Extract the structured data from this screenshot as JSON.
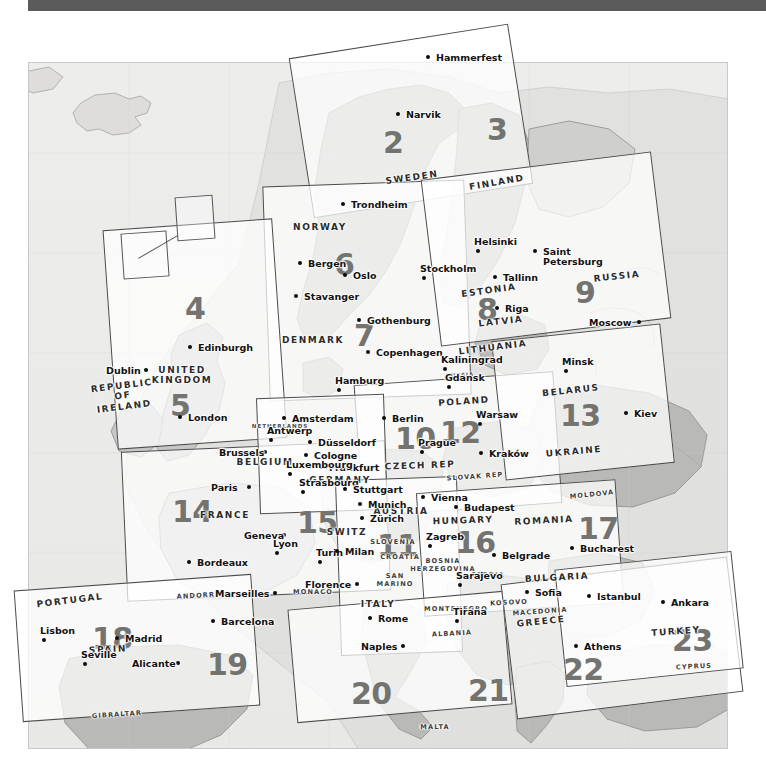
{
  "page": {
    "topbar_color": "#5a5a5a",
    "sheet_bg": "#ececeb",
    "land_fill": "#b9b9b7",
    "land_fill_light": "#d8d8d6",
    "tile_border": "#4b4b4b",
    "tile_number_color": "#73736f",
    "city_dot_color": "#0c0c0c"
  },
  "tiles": [
    {
      "id": "2",
      "label": "2"
    },
    {
      "id": "3",
      "label": "3"
    },
    {
      "id": "4",
      "label": "4"
    },
    {
      "id": "5",
      "label": "5"
    },
    {
      "id": "6",
      "label": "6"
    },
    {
      "id": "7",
      "label": "7"
    },
    {
      "id": "8",
      "label": "8"
    },
    {
      "id": "9",
      "label": "9"
    },
    {
      "id": "10",
      "label": "10"
    },
    {
      "id": "11",
      "label": "11"
    },
    {
      "id": "12",
      "label": "12"
    },
    {
      "id": "13",
      "label": "13"
    },
    {
      "id": "14",
      "label": "14"
    },
    {
      "id": "15",
      "label": "15"
    },
    {
      "id": "16",
      "label": "16"
    },
    {
      "id": "17",
      "label": "17"
    },
    {
      "id": "18",
      "label": "18"
    },
    {
      "id": "19",
      "label": "19"
    },
    {
      "id": "20",
      "label": "20"
    },
    {
      "id": "21",
      "label": "21"
    },
    {
      "id": "22",
      "label": "22"
    },
    {
      "id": "23",
      "label": "23"
    }
  ],
  "cities": [
    {
      "name": "Hammerfest",
      "x": 428,
      "y": 57,
      "dx": 8,
      "dy": -4
    },
    {
      "name": "Narvik",
      "x": 398,
      "y": 114,
      "dx": 8,
      "dy": -4
    },
    {
      "name": "Trondheim",
      "x": 343,
      "y": 204,
      "dx": 8,
      "dy": -4
    },
    {
      "name": "Bergen",
      "x": 300,
      "y": 263,
      "dx": 8,
      "dy": -4
    },
    {
      "name": "Oslo",
      "x": 345,
      "y": 275,
      "dx": 8,
      "dy": -4
    },
    {
      "name": "Stavanger",
      "x": 296,
      "y": 296,
      "dx": 8,
      "dy": -4
    },
    {
      "name": "Gothenburg",
      "x": 359,
      "y": 320,
      "dx": 8,
      "dy": -4
    },
    {
      "name": "Copenhagen",
      "x": 368,
      "y": 352,
      "dx": 8,
      "dy": -4
    },
    {
      "name": "Stockholm",
      "x": 424,
      "y": 278,
      "dx": -4,
      "dy": -14
    },
    {
      "name": "Helsinki",
      "x": 478,
      "y": 251,
      "dx": -4,
      "dy": -14
    },
    {
      "name": "Tallinn",
      "x": 495,
      "y": 277,
      "dx": 8,
      "dy": -4
    },
    {
      "name": "Riga",
      "x": 497,
      "y": 308,
      "dx": 8,
      "dy": -4
    },
    {
      "name": "Saint\nPetersburg",
      "x": 535,
      "y": 251,
      "dx": 8,
      "dy": -4
    },
    {
      "name": "Moscow",
      "x": 639,
      "y": 322,
      "dx": -50,
      "dy": -4
    },
    {
      "name": "Minsk",
      "x": 566,
      "y": 371,
      "dx": -4,
      "dy": -14
    },
    {
      "name": "Kiev",
      "x": 626,
      "y": 413,
      "dx": 8,
      "dy": -4
    },
    {
      "name": "Kaliningrad",
      "x": 445,
      "y": 369,
      "dx": -4,
      "dy": -14
    },
    {
      "name": "Gdansk",
      "x": 449,
      "y": 387,
      "dx": -4,
      "dy": -14
    },
    {
      "name": "Hamburg",
      "x": 339,
      "y": 390,
      "dx": -4,
      "dy": -14
    },
    {
      "name": "Warsaw",
      "x": 480,
      "y": 424,
      "dx": -4,
      "dy": -14
    },
    {
      "name": "Berlin",
      "x": 384,
      "y": 418,
      "dx": 8,
      "dy": -4
    },
    {
      "name": "Kraków",
      "x": 481,
      "y": 453,
      "dx": 8,
      "dy": -4
    },
    {
      "name": "Prague",
      "x": 422,
      "y": 452,
      "dx": -4,
      "dy": -14
    },
    {
      "name": "Amsterdam",
      "x": 284,
      "y": 418,
      "dx": 8,
      "dy": -4
    },
    {
      "name": "Antwerp",
      "x": 271,
      "y": 440,
      "dx": -4,
      "dy": -14
    },
    {
      "name": "Brussels",
      "x": 265,
      "y": 452,
      "dx": -46,
      "dy": -4
    },
    {
      "name": "Düsseldorf",
      "x": 310,
      "y": 442,
      "dx": 8,
      "dy": -4
    },
    {
      "name": "Cologne",
      "x": 306,
      "y": 455,
      "dx": 8,
      "dy": -4
    },
    {
      "name": "Frankfurt",
      "x": 321,
      "y": 467,
      "dx": 8,
      "dy": -4
    },
    {
      "name": "Luxembourg",
      "x": 290,
      "y": 474,
      "dx": -4,
      "dy": -14
    },
    {
      "name": "Strasbourg",
      "x": 303,
      "y": 492,
      "dx": -4,
      "dy": -14
    },
    {
      "name": "Stuttgart",
      "x": 345,
      "y": 489,
      "dx": 8,
      "dy": -4
    },
    {
      "name": "Munich",
      "x": 360,
      "y": 504,
      "dx": 8,
      "dy": -4
    },
    {
      "name": "Zürich",
      "x": 362,
      "y": 518,
      "dx": 8,
      "dy": -4
    },
    {
      "name": "Vienna",
      "x": 423,
      "y": 497,
      "dx": 8,
      "dy": -4
    },
    {
      "name": "Budapest",
      "x": 456,
      "y": 507,
      "dx": 8,
      "dy": -4
    },
    {
      "name": "Paris",
      "x": 249,
      "y": 487,
      "dx": -38,
      "dy": -4
    },
    {
      "name": "Geneva",
      "x": 284,
      "y": 535,
      "dx": -40,
      "dy": -4
    },
    {
      "name": "Lyon",
      "x": 277,
      "y": 553,
      "dx": -4,
      "dy": -14
    },
    {
      "name": "Bordeaux",
      "x": 189,
      "y": 562,
      "dx": 8,
      "dy": -4
    },
    {
      "name": "Marseilles",
      "x": 275,
      "y": 593,
      "dx": -60,
      "dy": -4
    },
    {
      "name": "Turin",
      "x": 320,
      "y": 562,
      "dx": -4,
      "dy": -14
    },
    {
      "name": "Milan",
      "x": 337,
      "y": 551,
      "dx": 8,
      "dy": -4
    },
    {
      "name": "Florence",
      "x": 357,
      "y": 584,
      "dx": -52,
      "dy": -4
    },
    {
      "name": "Rome",
      "x": 370,
      "y": 618,
      "dx": 8,
      "dy": -4
    },
    {
      "name": "Naples",
      "x": 403,
      "y": 646,
      "dx": -42,
      "dy": -4
    },
    {
      "name": "Zagreb",
      "x": 430,
      "y": 546,
      "dx": -4,
      "dy": -14
    },
    {
      "name": "Sarajevo",
      "x": 460,
      "y": 585,
      "dx": -4,
      "dy": -14
    },
    {
      "name": "Belgrade",
      "x": 494,
      "y": 555,
      "dx": 8,
      "dy": -4
    },
    {
      "name": "Bucharest",
      "x": 572,
      "y": 548,
      "dx": 8,
      "dy": -4
    },
    {
      "name": "Sofia",
      "x": 527,
      "y": 592,
      "dx": 8,
      "dy": -4
    },
    {
      "name": "Tirana",
      "x": 457,
      "y": 621,
      "dx": -4,
      "dy": -14
    },
    {
      "name": "Athens",
      "x": 576,
      "y": 646,
      "dx": 8,
      "dy": -4
    },
    {
      "name": "Istanbul",
      "x": 589,
      "y": 596,
      "dx": 8,
      "dy": -4
    },
    {
      "name": "Ankara",
      "x": 663,
      "y": 602,
      "dx": 8,
      "dy": -4
    },
    {
      "name": "Dublin",
      "x": 146,
      "y": 370,
      "dx": -40,
      "dy": -4
    },
    {
      "name": "Edinburgh",
      "x": 190,
      "y": 347,
      "dx": 8,
      "dy": -4
    },
    {
      "name": "London",
      "x": 180,
      "y": 417,
      "dx": 8,
      "dy": -4
    },
    {
      "name": "Lisbon",
      "x": 44,
      "y": 640,
      "dx": -4,
      "dy": -14
    },
    {
      "name": "Madrid",
      "x": 117,
      "y": 638,
      "dx": 8,
      "dy": -4
    },
    {
      "name": "Seville",
      "x": 85,
      "y": 664,
      "dx": -4,
      "dy": -14
    },
    {
      "name": "Alicante",
      "x": 178,
      "y": 663,
      "dx": -46,
      "dy": -4
    },
    {
      "name": "Barcelona",
      "x": 213,
      "y": 621,
      "dx": 8,
      "dy": -4
    }
  ],
  "countries": [
    {
      "name": "SWEDEN",
      "x": 412,
      "y": 178,
      "size": "md",
      "rot": -8
    },
    {
      "name": "FINLAND",
      "x": 497,
      "y": 183,
      "size": "md",
      "rot": -10
    },
    {
      "name": "NORWAY",
      "x": 320,
      "y": 228,
      "size": "md",
      "rot": 0
    },
    {
      "name": "DENMARK",
      "x": 313,
      "y": 341,
      "size": "md",
      "rot": 0
    },
    {
      "name": "ESTONIA",
      "x": 489,
      "y": 291,
      "size": "md",
      "rot": -8
    },
    {
      "name": "LATVIA",
      "x": 501,
      "y": 322,
      "size": "md",
      "rot": -6
    },
    {
      "name": "LITHUANIA",
      "x": 493,
      "y": 348,
      "size": "md",
      "rot": -7
    },
    {
      "name": "RUSSIA",
      "x": 617,
      "y": 277,
      "size": "md",
      "rot": -6
    },
    {
      "name": "RUSSIA",
      "x": 460,
      "y": 376,
      "size": "xs",
      "rot": -3
    },
    {
      "name": "BELARUS",
      "x": 571,
      "y": 391,
      "size": "md",
      "rot": -6
    },
    {
      "name": "UKRAINE",
      "x": 574,
      "y": 452,
      "size": "md",
      "rot": -5
    },
    {
      "name": "POLAND",
      "x": 464,
      "y": 402,
      "size": "md",
      "rot": -4
    },
    {
      "name": "NETHERLANDS",
      "x": 280,
      "y": 427,
      "size": "xs",
      "rot": 0
    },
    {
      "name": "BELGIUM",
      "x": 265,
      "y": 463,
      "size": "md",
      "rot": 0
    },
    {
      "name": "GERMANY",
      "x": 340,
      "y": 481,
      "size": "md",
      "rot": 0
    },
    {
      "name": "CZECH REP",
      "x": 420,
      "y": 466,
      "size": "md",
      "rot": -2
    },
    {
      "name": "SLOVAK REP",
      "x": 475,
      "y": 477,
      "size": "sm",
      "rot": -4
    },
    {
      "name": "AUSTRIA",
      "x": 401,
      "y": 512,
      "size": "md",
      "rot": 0
    },
    {
      "name": "HUNGARY",
      "x": 463,
      "y": 521,
      "size": "md",
      "rot": -2
    },
    {
      "name": "ROMANIA",
      "x": 544,
      "y": 521,
      "size": "md",
      "rot": -3
    },
    {
      "name": "MOLDOVA",
      "x": 592,
      "y": 495,
      "size": "sm",
      "rot": -6
    },
    {
      "name": "SWITZ",
      "x": 347,
      "y": 533,
      "size": "md",
      "rot": 0
    },
    {
      "name": "FRANCE",
      "x": 225,
      "y": 516,
      "size": "md",
      "rot": 0
    },
    {
      "name": "SLOVENIA",
      "x": 393,
      "y": 542,
      "size": "sm",
      "rot": 0
    },
    {
      "name": "CROATIA",
      "x": 400,
      "y": 557,
      "size": "sm",
      "rot": 0
    },
    {
      "name": "BOSNIA\nHERZEGOVINA",
      "x": 443,
      "y": 566,
      "size": "sm",
      "rot": 0
    },
    {
      "name": "SERBIA",
      "x": 488,
      "y": 575,
      "size": "sm",
      "rot": 0
    },
    {
      "name": "MONTENEGRO",
      "x": 456,
      "y": 609,
      "size": "sm",
      "rot": 0
    },
    {
      "name": "KOSOVO",
      "x": 509,
      "y": 603,
      "size": "sm",
      "rot": -3
    },
    {
      "name": "MACEDONIA",
      "x": 540,
      "y": 612,
      "size": "sm",
      "rot": -4
    },
    {
      "name": "ALBANIA",
      "x": 452,
      "y": 634,
      "size": "sm",
      "rot": -3
    },
    {
      "name": "BULGARIA",
      "x": 557,
      "y": 578,
      "size": "md",
      "rot": -3
    },
    {
      "name": "GREECE",
      "x": 541,
      "y": 622,
      "size": "md",
      "rot": -6
    },
    {
      "name": "TURKEY",
      "x": 676,
      "y": 632,
      "size": "md",
      "rot": -4
    },
    {
      "name": "CYPRUS",
      "x": 694,
      "y": 667,
      "size": "sm",
      "rot": -3
    },
    {
      "name": "ITALY",
      "x": 378,
      "y": 605,
      "size": "md",
      "rot": 0
    },
    {
      "name": "SAN\nMARINO",
      "x": 395,
      "y": 581,
      "size": "sm",
      "rot": 0
    },
    {
      "name": "MONACO",
      "x": 313,
      "y": 592,
      "size": "sm",
      "rot": 0
    },
    {
      "name": "ANDORRA",
      "x": 199,
      "y": 596,
      "size": "sm",
      "rot": -3
    },
    {
      "name": "SPAIN",
      "x": 108,
      "y": 650,
      "size": "md",
      "rot": -3
    },
    {
      "name": "PORTUGAL",
      "x": 70,
      "y": 601,
      "size": "md",
      "rot": -7
    },
    {
      "name": "GIBRALTAR",
      "x": 117,
      "y": 715,
      "size": "sm",
      "rot": -4
    },
    {
      "name": "MALTA",
      "x": 435,
      "y": 727,
      "size": "sm",
      "rot": 0
    },
    {
      "name": "UNITED\nKINGDOM",
      "x": 182,
      "y": 375,
      "size": "md",
      "rot": 0
    },
    {
      "name": "REPUBLIC\nOF\nIRELAND",
      "x": 123,
      "y": 396,
      "size": "md",
      "rot": -7
    }
  ]
}
